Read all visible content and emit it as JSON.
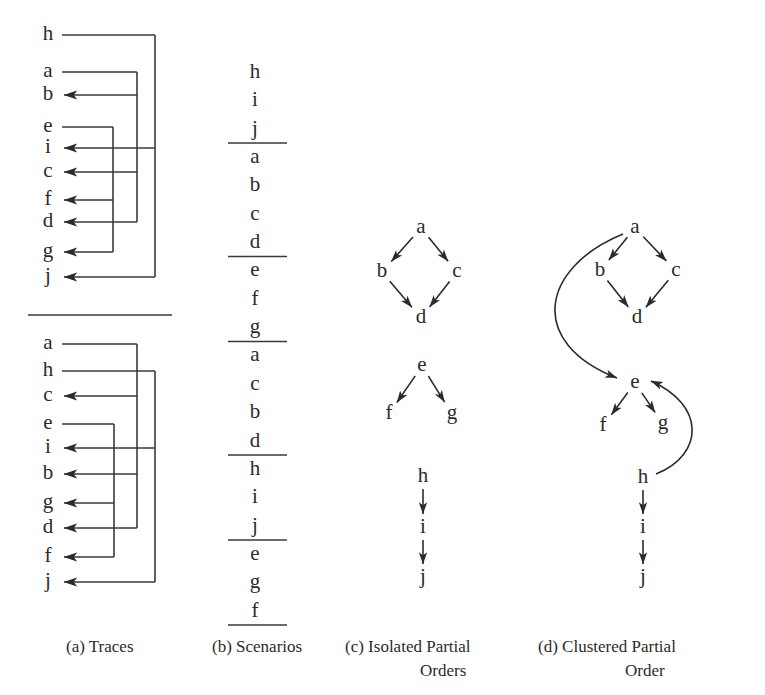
{
  "figure": {
    "ink_color": "#2b2b2b",
    "background_color": "#ffffff",
    "width": 765,
    "height": 695
  },
  "panels": {
    "a": {
      "caption_lines": [
        "(a) Traces"
      ],
      "caption_x": 66,
      "caption_y": 648,
      "traces": [
        {
          "name": "trace-1",
          "events": [
            "h",
            "a",
            "b",
            "e",
            "i",
            "c",
            "f",
            "d",
            "g",
            "j"
          ],
          "event_y": [
            35,
            72,
            95,
            127,
            148,
            172,
            200,
            222,
            252,
            277
          ],
          "label_x": 48,
          "channels": [
            {
              "from": "h",
              "to": [
                "i",
                "j"
              ],
              "x": 155
            },
            {
              "from": "a",
              "to": [
                "b",
                "c",
                "d"
              ],
              "x": 137
            },
            {
              "from": "e",
              "to": [
                "f",
                "g"
              ],
              "x": 113
            }
          ]
        },
        {
          "name": "trace-2",
          "events": [
            "a",
            "h",
            "c",
            "e",
            "i",
            "b",
            "g",
            "d",
            "f",
            "j"
          ],
          "event_y": [
            344,
            371,
            396,
            424,
            448,
            474,
            503,
            528,
            557,
            582
          ],
          "label_x": 48,
          "channels": [
            {
              "from": "a",
              "to": [
                "c",
                "b",
                "d"
              ],
              "x": 137
            },
            {
              "from": "h",
              "to": [
                "i",
                "j"
              ],
              "x": 155
            },
            {
              "from": "e",
              "to": [
                "g",
                "f"
              ],
              "x": 114
            }
          ]
        }
      ],
      "divider": {
        "x1": 28,
        "x2": 172,
        "y": 315
      }
    },
    "b": {
      "caption_lines": [
        "(b) Scenarios"
      ],
      "caption_x": 212,
      "caption_y": 648,
      "column_x": 255,
      "rule_x1": 228,
      "rule_x2": 287,
      "top_rule_y": null,
      "scenarios": [
        {
          "events": [
            "h",
            "i",
            "j"
          ]
        },
        {
          "events": [
            "a",
            "b",
            "c",
            "d"
          ]
        },
        {
          "events": [
            "e",
            "f",
            "g"
          ]
        },
        {
          "events": [
            "a",
            "c",
            "b",
            "d"
          ]
        },
        {
          "events": [
            "h",
            "i",
            "j"
          ]
        },
        {
          "events": [
            "e",
            "g",
            "f"
          ]
        }
      ],
      "first_event_y": 73,
      "event_spacing": 28.5
    },
    "c": {
      "caption_lines": [
        "(c) Isolated Partial",
        "Orders"
      ],
      "caption_x": 345,
      "caption_y": 648,
      "caption_line2_x": 420,
      "graphs": [
        {
          "name": "diamond-abcd",
          "nodes": [
            {
              "id": "a",
              "x": 421,
              "y": 228
            },
            {
              "id": "b",
              "x": 382,
              "y": 272
            },
            {
              "id": "c",
              "x": 457,
              "y": 272
            },
            {
              "id": "d",
              "x": 421,
              "y": 318
            }
          ],
          "edges": [
            {
              "from": "a",
              "to": "b"
            },
            {
              "from": "a",
              "to": "c"
            },
            {
              "from": "b",
              "to": "d"
            },
            {
              "from": "c",
              "to": "d"
            }
          ]
        },
        {
          "name": "fork-efg",
          "nodes": [
            {
              "id": "e",
              "x": 422,
              "y": 366
            },
            {
              "id": "f",
              "x": 389,
              "y": 414
            },
            {
              "id": "g",
              "x": 452,
              "y": 414
            }
          ],
          "edges": [
            {
              "from": "e",
              "to": "f"
            },
            {
              "from": "e",
              "to": "g"
            }
          ]
        },
        {
          "name": "chain-hij",
          "nodes": [
            {
              "id": "h",
              "x": 423,
              "y": 477
            },
            {
              "id": "i",
              "x": 423,
              "y": 528
            },
            {
              "id": "j",
              "x": 423,
              "y": 578
            }
          ],
          "edges": [
            {
              "from": "h",
              "to": "i"
            },
            {
              "from": "i",
              "to": "j"
            }
          ]
        }
      ]
    },
    "d": {
      "caption_lines": [
        "(d) Clustered Partial",
        "Order"
      ],
      "caption_x": 538,
      "caption_y": 648,
      "caption_line2_x": 625,
      "graph": {
        "name": "clustered-order",
        "nodes": [
          {
            "id": "a",
            "x": 635,
            "y": 228
          },
          {
            "id": "b",
            "x": 600,
            "y": 271
          },
          {
            "id": "c",
            "x": 676,
            "y": 271
          },
          {
            "id": "d",
            "x": 637,
            "y": 318
          },
          {
            "id": "e",
            "x": 635,
            "y": 383
          },
          {
            "id": "f",
            "x": 603,
            "y": 426
          },
          {
            "id": "g",
            "x": 663,
            "y": 424
          },
          {
            "id": "h",
            "x": 643,
            "y": 478
          },
          {
            "id": "i",
            "x": 643,
            "y": 528
          },
          {
            "id": "j",
            "x": 643,
            "y": 578
          }
        ],
        "edges": [
          {
            "from": "a",
            "to": "b",
            "kind": "straight"
          },
          {
            "from": "a",
            "to": "c",
            "kind": "straight"
          },
          {
            "from": "b",
            "to": "d",
            "kind": "straight"
          },
          {
            "from": "c",
            "to": "d",
            "kind": "straight"
          },
          {
            "from": "e",
            "to": "f",
            "kind": "straight"
          },
          {
            "from": "e",
            "to": "g",
            "kind": "straight"
          },
          {
            "from": "h",
            "to": "i",
            "kind": "straight"
          },
          {
            "from": "i",
            "to": "j",
            "kind": "straight"
          },
          {
            "from": "a",
            "to": "e",
            "kind": "curve-left"
          },
          {
            "from": "h",
            "to": "e",
            "kind": "curve-right"
          }
        ]
      }
    }
  }
}
